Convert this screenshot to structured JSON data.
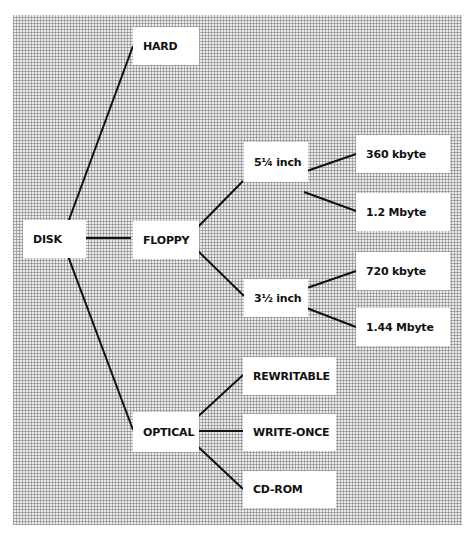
{
  "diagram": {
    "type": "tree",
    "root": "DISK",
    "nodes": [
      {
        "id": "disk",
        "label": "DISK",
        "x": 23,
        "y": 220,
        "w": 63,
        "h": 38
      },
      {
        "id": "hard",
        "label": "HARD",
        "x": 133,
        "y": 27,
        "w": 66,
        "h": 38
      },
      {
        "id": "floppy",
        "label": "FLOPPY",
        "x": 133,
        "y": 221,
        "w": 66,
        "h": 38
      },
      {
        "id": "optical",
        "label": "OPTICAL",
        "x": 133,
        "y": 412,
        "w": 66,
        "h": 40
      },
      {
        "id": "f525",
        "label": "5¼ inch",
        "x": 244,
        "y": 142,
        "w": 64,
        "h": 40
      },
      {
        "id": "f35",
        "label": "3½ inch",
        "x": 244,
        "y": 279,
        "w": 64,
        "h": 38
      },
      {
        "id": "k360",
        "label": "360 kbyte",
        "x": 356,
        "y": 135,
        "w": 94,
        "h": 38
      },
      {
        "id": "m12",
        "label": "1.2 Mbyte",
        "x": 356,
        "y": 193,
        "w": 94,
        "h": 38
      },
      {
        "id": "k720",
        "label": "720 kbyte",
        "x": 356,
        "y": 252,
        "w": 94,
        "h": 38
      },
      {
        "id": "m144",
        "label": "1.44 Mbyte",
        "x": 356,
        "y": 308,
        "w": 94,
        "h": 38
      },
      {
        "id": "rewritable",
        "label": "REWRITABLE",
        "x": 243,
        "y": 357,
        "w": 93,
        "h": 38
      },
      {
        "id": "writeonce",
        "label": "WRITE-ONCE",
        "x": 243,
        "y": 414,
        "w": 93,
        "h": 37
      },
      {
        "id": "cdrom",
        "label": "CD-ROM",
        "x": 243,
        "y": 471,
        "w": 93,
        "h": 37
      }
    ],
    "edges": [
      {
        "from": "disk",
        "to": "hard",
        "x1": 66,
        "y1": 228,
        "x2": 133,
        "y2": 46
      },
      {
        "from": "disk",
        "to": "floppy",
        "x1": 66,
        "y1": 238,
        "x2": 131,
        "y2": 238
      },
      {
        "from": "disk",
        "to": "optical",
        "x1": 65,
        "y1": 248,
        "x2": 133,
        "y2": 430
      },
      {
        "from": "floppy",
        "to": "f525",
        "x1": 196,
        "y1": 229,
        "x2": 243,
        "y2": 181
      },
      {
        "from": "floppy",
        "to": "f35",
        "x1": 196,
        "y1": 249,
        "x2": 244,
        "y2": 296
      },
      {
        "from": "f525",
        "to": "k360",
        "x1": 304,
        "y1": 172,
        "x2": 356,
        "y2": 154
      },
      {
        "from": "f525",
        "to": "m12",
        "x1": 304,
        "y1": 192,
        "x2": 356,
        "y2": 211
      },
      {
        "from": "f35",
        "to": "k720",
        "x1": 304,
        "y1": 289,
        "x2": 356,
        "y2": 271
      },
      {
        "from": "f35",
        "to": "m144",
        "x1": 304,
        "y1": 307,
        "x2": 356,
        "y2": 327
      },
      {
        "from": "optical",
        "to": "rewritable",
        "x1": 192,
        "y1": 422,
        "x2": 243,
        "y2": 375
      },
      {
        "from": "optical",
        "to": "writeonce",
        "x1": 190,
        "y1": 431,
        "x2": 243,
        "y2": 431
      },
      {
        "from": "optical",
        "to": "cdrom",
        "x1": 192,
        "y1": 441,
        "x2": 243,
        "y2": 489
      }
    ],
    "colors": {
      "line": "#111111",
      "box": "#ffffff",
      "text": "#111111"
    }
  }
}
